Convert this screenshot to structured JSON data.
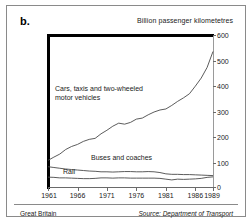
{
  "panel": {
    "letter": "b."
  },
  "footer": {
    "region": "Great Britain",
    "source": "Source: Department of Transport"
  },
  "chart_data": {
    "type": "line",
    "title": "Billion passenger kilometetres",
    "xlabel": "",
    "ylabel": "Billion passenger kilometetres",
    "xlim": [
      1961,
      1989
    ],
    "ylim": [
      0,
      600
    ],
    "yticks": [
      0,
      100,
      200,
      300,
      400,
      500,
      600
    ],
    "xticks": [
      1961,
      1966,
      1971,
      1976,
      1981,
      1986,
      1989
    ],
    "grid": false,
    "legend": "inline-annotations",
    "x": [
      1961,
      1962,
      1963,
      1964,
      1965,
      1966,
      1967,
      1968,
      1969,
      1970,
      1971,
      1972,
      1973,
      1974,
      1975,
      1976,
      1977,
      1978,
      1979,
      1980,
      1981,
      1982,
      1983,
      1984,
      1985,
      1986,
      1987,
      1988,
      1989
    ],
    "series": [
      {
        "name": "Cars, taxis and two-wheeled motor vehicles",
        "label": "Cars, taxis and two-wheeled motor vehicles",
        "label_lines": [
          "Cars, taxis and two-wheeled",
          "motor vehicles"
        ],
        "values": [
          105,
          118,
          130,
          148,
          160,
          168,
          180,
          188,
          192,
          210,
          224,
          240,
          252,
          248,
          255,
          268,
          272,
          285,
          296,
          304,
          308,
          322,
          338,
          352,
          368,
          398,
          430,
          472,
          535
        ]
      },
      {
        "name": "Buses and coaches",
        "label": "Buses and coaches",
        "label_lines": [
          "Buses and coaches"
        ],
        "values": [
          80,
          77,
          74,
          71,
          69,
          67,
          65,
          63,
          62,
          60,
          60,
          59,
          60,
          61,
          61,
          60,
          60,
          61,
          60,
          57,
          52,
          50,
          50,
          49,
          49,
          48,
          47,
          46,
          45
        ]
      },
      {
        "name": "Rail",
        "label": "Rail",
        "label_lines": [
          "Rail"
        ],
        "values": [
          39,
          38,
          36,
          36,
          35,
          34,
          33,
          33,
          34,
          36,
          36,
          35,
          36,
          36,
          35,
          35,
          35,
          35,
          35,
          34,
          31,
          28,
          31,
          30,
          31,
          32,
          34,
          38,
          40
        ]
      }
    ]
  }
}
